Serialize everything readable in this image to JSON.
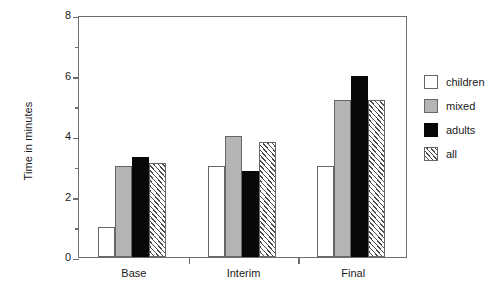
{
  "chart_data": {
    "type": "bar",
    "title": "",
    "xlabel": "",
    "ylabel": "Time in minutes",
    "categories": [
      "Base",
      "Interim",
      "Final"
    ],
    "series": [
      {
        "name": "children",
        "values": [
          1.0,
          3.0,
          3.0
        ],
        "fill": "white",
        "color": "#ffffff"
      },
      {
        "name": "mixed",
        "values": [
          3.0,
          4.0,
          5.2
        ],
        "fill": "gray",
        "color": "#b4b4b4"
      },
      {
        "name": "adults",
        "values": [
          3.3,
          2.85,
          6.0
        ],
        "fill": "black",
        "color": "#080808"
      },
      {
        "name": "all",
        "values": [
          3.1,
          3.8,
          5.2
        ],
        "fill": "hatched",
        "color": "#ffffff"
      }
    ],
    "ylim": [
      0,
      8
    ],
    "y_major_ticks": [
      0,
      2,
      4,
      6,
      8
    ],
    "y_minor_ticks": [
      1,
      3,
      5,
      7
    ],
    "y_tick_labels": [
      "0",
      "2",
      "4",
      "6",
      "8"
    ],
    "grid": false,
    "legend_position": "right",
    "legend_entries": [
      "children",
      "mixed",
      "adults",
      "all"
    ]
  },
  "axes": {
    "y_title": "Time in minutes",
    "y_labels": [
      "8",
      "6",
      "4",
      "2",
      "0"
    ],
    "x_labels": [
      "Base",
      "Interim",
      "Final"
    ]
  },
  "legend": {
    "items": [
      {
        "label": "children"
      },
      {
        "label": "mixed"
      },
      {
        "label": "adults"
      },
      {
        "label": "all"
      }
    ]
  }
}
